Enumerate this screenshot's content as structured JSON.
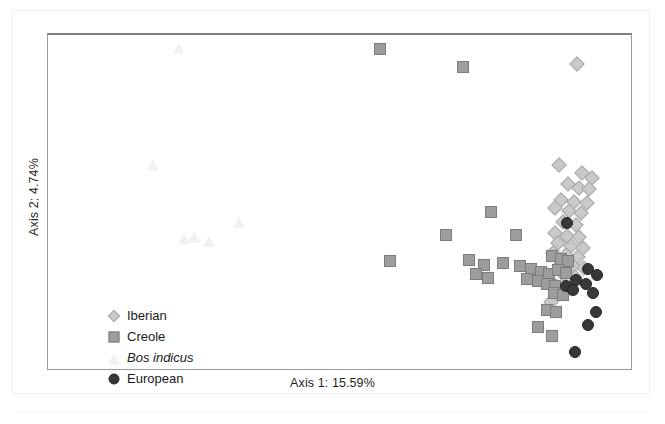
{
  "figure": {
    "title": "",
    "xaxis_title": "Axis 1: 15.59%",
    "yaxis_title": "Axis 2: 4.74%"
  },
  "legend": {
    "items": [
      {
        "label": "Iberian",
        "marker": "diamond",
        "color": "#c9c9c9",
        "italic": false
      },
      {
        "label": "Creole",
        "marker": "square",
        "color": "#9d9d9d",
        "italic": false
      },
      {
        "label": "Bos indicus",
        "marker": "triangle",
        "color": "#f1f1f1",
        "italic": true
      },
      {
        "label": "European",
        "marker": "circle",
        "color": "#383838",
        "italic": false
      }
    ]
  },
  "chart_data": {
    "type": "scatter",
    "title": "",
    "xlabel": "Axis 1: 15.59%",
    "ylabel": "Axis 2: 4.74%",
    "xlim": [
      0,
      100
    ],
    "ylim": [
      0,
      100
    ],
    "grid": false,
    "axis_ticks": [],
    "legend_position": "inside-lower-left",
    "series": [
      {
        "name": "Iberian",
        "marker": "diamond",
        "color": "#c9c9c9",
        "points": [
          [
            90.8,
            91.4
          ],
          [
            87.6,
            61.1
          ],
          [
            91.6,
            58.7
          ],
          [
            93.3,
            57.2
          ],
          [
            89.2,
            55.4
          ],
          [
            91.1,
            54.3
          ],
          [
            92.8,
            53.8
          ],
          [
            88.0,
            50.7
          ],
          [
            90.3,
            50.1
          ],
          [
            92.4,
            49.7
          ],
          [
            87.0,
            48.2
          ],
          [
            89.4,
            47.4
          ],
          [
            91.5,
            46.6
          ],
          [
            88.3,
            43.9
          ],
          [
            90.6,
            43.2
          ],
          [
            86.9,
            40.6
          ],
          [
            89.0,
            39.9
          ],
          [
            91.0,
            39.4
          ],
          [
            87.4,
            37.6
          ],
          [
            89.7,
            36.9
          ],
          [
            91.8,
            36.3
          ],
          [
            86.6,
            34.8
          ],
          [
            88.8,
            34.1
          ],
          [
            90.9,
            33.5
          ],
          [
            87.9,
            31.6
          ],
          [
            90.0,
            31.0
          ],
          [
            92.0,
            30.4
          ],
          [
            88.5,
            28.3
          ],
          [
            90.4,
            27.6
          ],
          [
            87.2,
            24.9
          ],
          [
            89.3,
            24.2
          ],
          [
            86.3,
            20.1
          ]
        ]
      },
      {
        "name": "Creole",
        "marker": "square",
        "color": "#9d9d9d",
        "points": [
          [
            57.0,
            95.7
          ],
          [
            71.2,
            90.4
          ],
          [
            58.6,
            32.4
          ],
          [
            68.2,
            40.1
          ],
          [
            76.0,
            47.0
          ],
          [
            72.2,
            32.6
          ],
          [
            74.8,
            31.2
          ],
          [
            73.4,
            28.4
          ],
          [
            75.4,
            27.4
          ],
          [
            80.2,
            40.2
          ],
          [
            78.0,
            31.9
          ],
          [
            81.0,
            31.0
          ],
          [
            82.9,
            30.0
          ],
          [
            84.6,
            29.2
          ],
          [
            86.0,
            28.4
          ],
          [
            82.2,
            27.0
          ],
          [
            84.0,
            26.3
          ],
          [
            85.6,
            25.5
          ],
          [
            87.0,
            25.0
          ],
          [
            86.4,
            33.7
          ],
          [
            88.0,
            33.0
          ],
          [
            89.2,
            32.3
          ],
          [
            87.5,
            29.6
          ],
          [
            88.9,
            28.8
          ],
          [
            86.8,
            22.8
          ],
          [
            88.3,
            22.1
          ],
          [
            85.6,
            17.8
          ],
          [
            87.2,
            17.0
          ],
          [
            84.0,
            12.6
          ],
          [
            86.4,
            10.0
          ]
        ]
      },
      {
        "name": "Bos indicus",
        "marker": "triangle",
        "color": "#f1f1f1",
        "points": [
          [
            22.4,
            96.0
          ],
          [
            18.0,
            61.2
          ],
          [
            32.8,
            44.0
          ],
          [
            23.4,
            38.8
          ],
          [
            25.1,
            39.4
          ],
          [
            27.6,
            38.4
          ]
        ]
      },
      {
        "name": "European",
        "marker": "circle",
        "color": "#383838",
        "points": [
          [
            89.0,
            43.7
          ],
          [
            92.6,
            29.9
          ],
          [
            94.2,
            28.2
          ],
          [
            90.6,
            26.8
          ],
          [
            92.3,
            25.4
          ],
          [
            88.8,
            25.0
          ],
          [
            90.1,
            23.6
          ],
          [
            93.4,
            22.7
          ],
          [
            94.0,
            17.2
          ],
          [
            92.6,
            13.2
          ],
          [
            90.4,
            5.0
          ]
        ]
      }
    ]
  }
}
